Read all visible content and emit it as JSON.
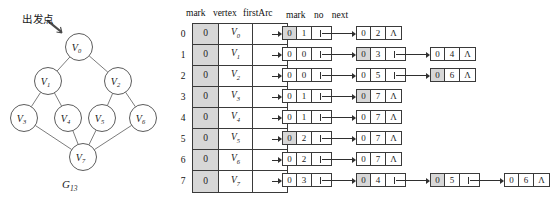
{
  "graph": {
    "annotation_label": "出发点",
    "caption": "G",
    "caption_sub": "13",
    "nodes": [
      {
        "id": "V0",
        "label": "V",
        "sub": "0",
        "x": 79,
        "y": 47
      },
      {
        "id": "V1",
        "label": "V",
        "sub": "1",
        "x": 48,
        "y": 81
      },
      {
        "id": "V2",
        "label": "V",
        "sub": "2",
        "x": 118,
        "y": 81
      },
      {
        "id": "V3",
        "label": "V",
        "sub": "3",
        "x": 24,
        "y": 118
      },
      {
        "id": "V4",
        "label": "V",
        "sub": "4",
        "x": 68,
        "y": 118
      },
      {
        "id": "V5",
        "label": "V",
        "sub": "5",
        "x": 102,
        "y": 118
      },
      {
        "id": "V6",
        "label": "V",
        "sub": "6",
        "x": 143,
        "y": 118
      },
      {
        "id": "V7",
        "label": "V",
        "sub": "7",
        "x": 83,
        "y": 157
      }
    ],
    "edges": [
      [
        "V0",
        "V1"
      ],
      [
        "V0",
        "V2"
      ],
      [
        "V1",
        "V3"
      ],
      [
        "V1",
        "V4"
      ],
      [
        "V2",
        "V5"
      ],
      [
        "V2",
        "V6"
      ],
      [
        "V3",
        "V7"
      ],
      [
        "V4",
        "V7"
      ],
      [
        "V5",
        "V7"
      ],
      [
        "V6",
        "V7"
      ]
    ]
  },
  "headers": {
    "vertex_table": [
      "mark",
      "vertex",
      "firstArc"
    ],
    "arc_node": [
      "mark",
      "no",
      "next"
    ]
  },
  "nil_symbol": "Λ",
  "rows": [
    {
      "index": "0",
      "mark": "0",
      "vertex": "V",
      "vertex_sub": "0",
      "arcs": [
        {
          "mark": "0",
          "no": "1",
          "shaded": true,
          "nil": false
        },
        {
          "mark": "0",
          "no": "2",
          "shaded": false,
          "nil": true
        }
      ]
    },
    {
      "index": "1",
      "mark": "0",
      "vertex": "V",
      "vertex_sub": "1",
      "arcs": [
        {
          "mark": "0",
          "no": "0",
          "shaded": false,
          "nil": false
        },
        {
          "mark": "0",
          "no": "3",
          "shaded": true,
          "nil": false
        },
        {
          "mark": "0",
          "no": "4",
          "shaded": false,
          "nil": true
        }
      ]
    },
    {
      "index": "2",
      "mark": "0",
      "vertex": "V",
      "vertex_sub": "2",
      "arcs": [
        {
          "mark": "0",
          "no": "0",
          "shaded": false,
          "nil": false
        },
        {
          "mark": "0",
          "no": "5",
          "shaded": false,
          "nil": false
        },
        {
          "mark": "0",
          "no": "6",
          "shaded": true,
          "nil": true
        }
      ]
    },
    {
      "index": "3",
      "mark": "0",
      "vertex": "V",
      "vertex_sub": "3",
      "arcs": [
        {
          "mark": "0",
          "no": "1",
          "shaded": false,
          "nil": false
        },
        {
          "mark": "0",
          "no": "7",
          "shaded": true,
          "nil": true
        }
      ]
    },
    {
      "index": "4",
      "mark": "0",
      "vertex": "V",
      "vertex_sub": "4",
      "arcs": [
        {
          "mark": "0",
          "no": "1",
          "shaded": false,
          "nil": false
        },
        {
          "mark": "0",
          "no": "7",
          "shaded": false,
          "nil": true
        }
      ]
    },
    {
      "index": "5",
      "mark": "0",
      "vertex": "V",
      "vertex_sub": "5",
      "arcs": [
        {
          "mark": "0",
          "no": "2",
          "shaded": true,
          "nil": false
        },
        {
          "mark": "0",
          "no": "7",
          "shaded": false,
          "nil": true
        }
      ]
    },
    {
      "index": "6",
      "mark": "0",
      "vertex": "V",
      "vertex_sub": "6",
      "arcs": [
        {
          "mark": "0",
          "no": "2",
          "shaded": false,
          "nil": false
        },
        {
          "mark": "0",
          "no": "7",
          "shaded": false,
          "nil": true
        }
      ]
    },
    {
      "index": "7",
      "mark": "0",
      "vertex": "V",
      "vertex_sub": "7",
      "arcs": [
        {
          "mark": "0",
          "no": "3",
          "shaded": false,
          "nil": false
        },
        {
          "mark": "0",
          "no": "4",
          "shaded": true,
          "nil": false
        },
        {
          "mark": "0",
          "no": "5",
          "shaded": true,
          "nil": false
        },
        {
          "mark": "0",
          "no": "6",
          "shaded": false,
          "nil": true
        }
      ]
    }
  ]
}
